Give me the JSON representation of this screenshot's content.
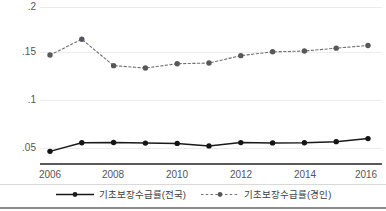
{
  "chart_data": {
    "type": "line",
    "title": "",
    "subtitle": "",
    "xlabel": "",
    "ylabel": "",
    "x": [
      2006,
      2007,
      2008,
      2009,
      2010,
      2011,
      2012,
      2013,
      2014,
      2015,
      2016
    ],
    "xlim": [
      2006,
      2016
    ],
    "ylim": [
      0.043,
      0.202
    ],
    "xticks": [
      2006,
      2008,
      2010,
      2012,
      2014,
      2016
    ],
    "xtick_labels": [
      "2006",
      "2008",
      "2010",
      "2012",
      "2014",
      "2016"
    ],
    "yticks": [
      0.05,
      0.1,
      0.15,
      0.2
    ],
    "ytick_labels": [
      ".05",
      ".1",
      ".15",
      ".2"
    ],
    "grid": true,
    "grid_axis": "y",
    "legend_position": "bottom",
    "series": [
      {
        "name": "기초보장수급률(전국)",
        "style": "solid",
        "color": "#1a1a1a",
        "marker": "circle",
        "values": [
          0.0465,
          0.0555,
          0.0558,
          0.0551,
          0.0548,
          0.0522,
          0.0556,
          0.0553,
          0.0554,
          0.0566,
          0.0598
        ]
      },
      {
        "name": "기초보장수급률(경인)",
        "style": "dashed",
        "color": "#6f7073",
        "marker": "circle",
        "values": [
          0.1468,
          0.1633,
          0.1358,
          0.1333,
          0.1378,
          0.1385,
          0.1462,
          0.1502,
          0.151,
          0.154,
          0.1568
        ]
      }
    ]
  },
  "legend": {
    "items": [
      {
        "label": "기초보장수급률(전국)",
        "style": "solid",
        "color": "#1a1a1a"
      },
      {
        "label": "기초보장수급률(경인)",
        "style": "dashed",
        "color": "#6f7073"
      }
    ]
  },
  "axes": {
    "y_tick_labels": [
      ".2",
      ".15",
      ".1",
      ".05"
    ],
    "x_tick_labels": [
      "2006",
      "2008",
      "2010",
      "2012",
      "2014",
      "2016"
    ]
  },
  "colors": {
    "series_national": "#1a1a1a",
    "series_gyeongin": "#6f7073",
    "gridline": "#ececed",
    "axis": "#58595b",
    "tick_text": "#555658",
    "background": "#ffffff"
  }
}
